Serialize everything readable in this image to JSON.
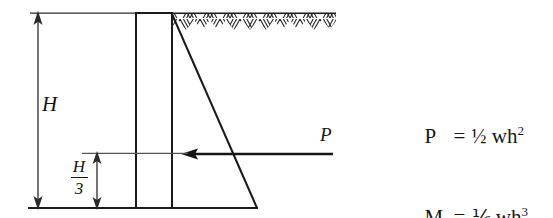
{
  "figure": {
    "labels": {
      "height": "H",
      "resultant_force": "P",
      "lever_arm_numerator": "H",
      "lever_arm_denominator": "3"
    },
    "formulas": [
      {
        "id": "pressure-resultant",
        "lhs": "P",
        "equals": "=",
        "coefficient": "½",
        "expression": "wh",
        "exponent": "2"
      },
      {
        "id": "overturning-moment",
        "lhs": "M",
        "equals": "=",
        "coefficient": "⅙",
        "expression": "wh",
        "exponent": "3"
      }
    ],
    "colors": {
      "line": "#1a1a1a",
      "background": "#ffffff",
      "hatch": "#333333"
    },
    "geometry": {
      "wall": {
        "x": 136,
        "y": 13,
        "width": 36,
        "height": 195
      },
      "ground_line_y": 13,
      "base_line_y": 208,
      "pressure_triangle_apex_x": 172,
      "pressure_triangle_base_x": 257,
      "force_arrow_y": 154,
      "force_arrow_tail_x": 333,
      "force_arrow_head_x": 183,
      "dim_H_x": 38,
      "dim_H3_x": 97,
      "dim_H3_top_y": 153
    }
  }
}
